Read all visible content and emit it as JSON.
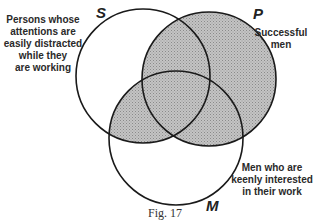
{
  "figure": {
    "caption": "Fig. 17",
    "type": "venn-diagram",
    "shading_color": "#b8b8b8",
    "outline_color": "#1a1a1a"
  },
  "sets": [
    {
      "letter": "S",
      "label_lines": [
        "Persons whose",
        "attentions are",
        "easily distracted",
        "while they",
        "are working"
      ],
      "cx": 143,
      "cy": 76,
      "r": 67
    },
    {
      "letter": "P",
      "label_lines": [
        "Successful",
        "men"
      ],
      "cx": 209,
      "cy": 79,
      "r": 67
    },
    {
      "letter": "M",
      "label_lines": [
        "Men who are",
        "keenly interested",
        "in their work"
      ],
      "cx": 176,
      "cy": 138,
      "r": 67
    }
  ],
  "labels": {
    "s_letter": "S",
    "p_letter": "P",
    "m_letter": "M",
    "s_text": "Persons whose\nattentions are\neasily distracted\nwhile they\nare working",
    "p_text": "Successful\nmen",
    "m_text": "Men who are\nkeenly interested\nin their work"
  },
  "shaded_regions": [
    "P (entire circle)",
    "S ∩ M"
  ]
}
